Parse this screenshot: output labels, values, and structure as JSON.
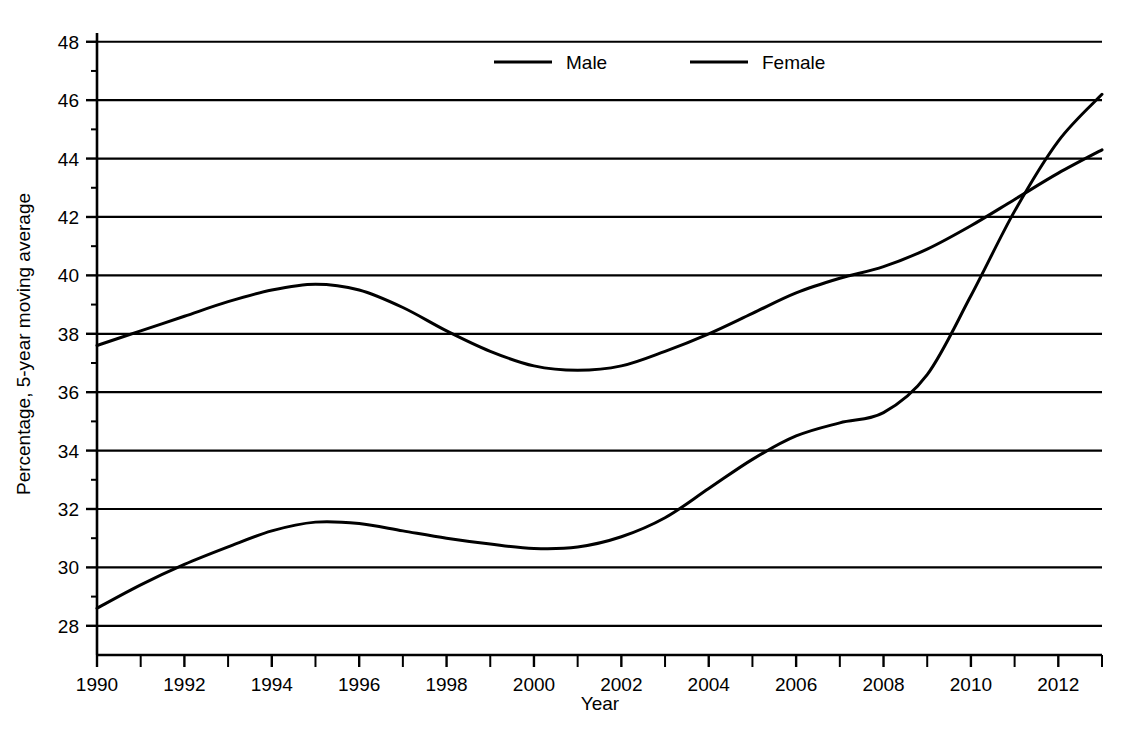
{
  "chart_data": {
    "type": "line",
    "title": "",
    "subtitle": "",
    "xlabel": "Year",
    "ylabel": "Percentage, 5-year moving average",
    "xlim": [
      1990,
      2013
    ],
    "ylim": [
      27,
      48.3
    ],
    "grid": "horizontal",
    "legend_position": "top-center",
    "y_ticks": [
      28,
      30,
      32,
      34,
      36,
      38,
      40,
      42,
      44,
      46,
      48
    ],
    "y_tick_labels": [
      "28",
      "30",
      "32",
      "34",
      "36",
      "38",
      "40",
      "42",
      "44",
      "46",
      "48"
    ],
    "y_minor_ticks": [
      29,
      31,
      33,
      35,
      37,
      39,
      41,
      43,
      45,
      47
    ],
    "x_ticks": [
      1990,
      1992,
      1994,
      1996,
      1998,
      2000,
      2002,
      2004,
      2006,
      2008,
      2010,
      2012
    ],
    "x_tick_labels": [
      "1990",
      "1992",
      "1994",
      "1996",
      "1998",
      "2000",
      "2002",
      "2004",
      "2006",
      "2008",
      "2010",
      "2012"
    ],
    "x_minor_ticks": [
      1991,
      1993,
      1995,
      1997,
      1999,
      2001,
      2003,
      2005,
      2007,
      2009,
      2011,
      2013
    ],
    "x": [
      1990,
      1991,
      1992,
      1993,
      1994,
      1995,
      1996,
      1997,
      1998,
      1999,
      2000,
      2001,
      2002,
      2003,
      2004,
      2005,
      2006,
      2007,
      2008,
      2009,
      2010,
      2011,
      2012,
      2013
    ],
    "series": [
      {
        "name": "Male",
        "color": "#000000",
        "values": [
          37.6,
          38.1,
          38.6,
          39.1,
          39.5,
          39.7,
          39.5,
          38.9,
          38.1,
          37.4,
          36.9,
          36.75,
          36.9,
          37.4,
          38.0,
          38.7,
          39.4,
          39.9,
          40.3,
          40.9,
          41.7,
          42.6,
          43.5,
          44.3
        ]
      },
      {
        "name": "Female",
        "color": "#000000",
        "values": [
          28.6,
          29.4,
          30.1,
          30.7,
          31.25,
          31.55,
          31.5,
          31.25,
          31.0,
          30.8,
          30.65,
          30.7,
          31.05,
          31.7,
          32.7,
          33.7,
          34.5,
          34.95,
          35.3,
          36.6,
          39.3,
          42.2,
          44.6,
          46.2
        ]
      }
    ]
  },
  "legend": {
    "items": [
      {
        "label": "Male"
      },
      {
        "label": "Female"
      }
    ]
  },
  "axes": {
    "x_title": "Year",
    "y_title": "Percentage, 5-year moving average"
  }
}
